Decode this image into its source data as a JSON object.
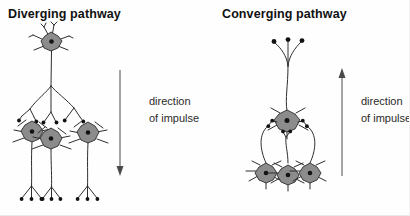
{
  "figure": {
    "width": 410,
    "height": 216,
    "background_color": "#fefefe"
  },
  "panels": [
    {
      "id": "diverging",
      "title": "Diverging pathway",
      "description": "one presynaptic neuron signalling onto three postsynaptic neurons",
      "input_neuron_count": 1,
      "output_neuron_count": 3,
      "arrow": {
        "label_line_1": "direction",
        "label_line_2": "of impulse",
        "direction": "down"
      }
    },
    {
      "id": "converging",
      "title": "Converging pathway",
      "description": "three presynaptic neurons signalling onto one postsynaptic neuron",
      "input_neuron_count": 3,
      "output_neuron_count": 1,
      "arrow": {
        "label_line_1": "direction",
        "label_line_2": "of impulse",
        "direction": "up"
      }
    }
  ],
  "colors": {
    "soma_fill": "#8c8c8c",
    "soma_stroke": "#2b2b2b",
    "nucleus": "#141414",
    "neurite": "#2e2e2e",
    "arrow": "#4a4a4a",
    "title_text": "#111111",
    "caption_text": "#2a2a2a"
  },
  "icons": {
    "neuron": "neuron-soma-icon",
    "axon": "axon-icon",
    "terminal": "axon-terminal-icon",
    "arrow_down": "arrow-down-icon",
    "arrow_up": "arrow-up-icon"
  }
}
